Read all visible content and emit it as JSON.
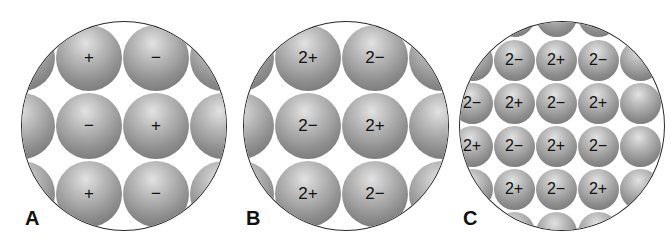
{
  "panels": [
    {
      "label": "A",
      "charges": [
        [
          "+",
          "−"
        ],
        [
          "−",
          "+"
        ],
        [
          "+",
          "−"
        ]
      ]
    },
    {
      "label": "B",
      "charges": [
        [
          "2+",
          "2−"
        ],
        [
          "2−",
          "2+"
        ],
        [
          "2+",
          "2−"
        ]
      ]
    },
    {
      "label": "C",
      "charges": [
        [
          "2+",
          "2−",
          "2+",
          "2−"
        ],
        [
          "2−",
          "2+",
          "2−",
          "2+"
        ],
        [
          "2+",
          "2−",
          "2+",
          "2−"
        ],
        [
          "2−",
          "2+",
          "2−",
          "2+"
        ]
      ]
    }
  ]
}
